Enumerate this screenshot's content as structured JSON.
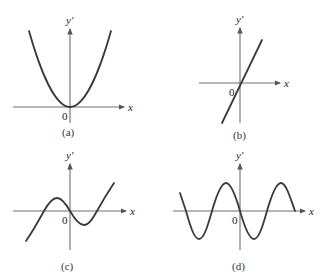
{
  "figure": {
    "panels": [
      {
        "id": "a",
        "caption": "(a)",
        "y_label": "y′",
        "x_label": "x",
        "origin_label": "0",
        "shape": "parabola"
      },
      {
        "id": "b",
        "caption": "(b)",
        "y_label": "y′",
        "x_label": "x",
        "origin_label": "0",
        "shape": "line"
      },
      {
        "id": "c",
        "caption": "(c)",
        "y_label": "y′",
        "x_label": "x",
        "origin_label": "0",
        "shape": "cubic"
      },
      {
        "id": "d",
        "caption": "(d)",
        "y_label": "y′",
        "x_label": "x",
        "origin_label": "0",
        "shape": "sinusoid"
      }
    ]
  },
  "colors": {
    "axis": "#6e6e6e",
    "curve": "#3a3a3a",
    "background": "#ffffff"
  }
}
